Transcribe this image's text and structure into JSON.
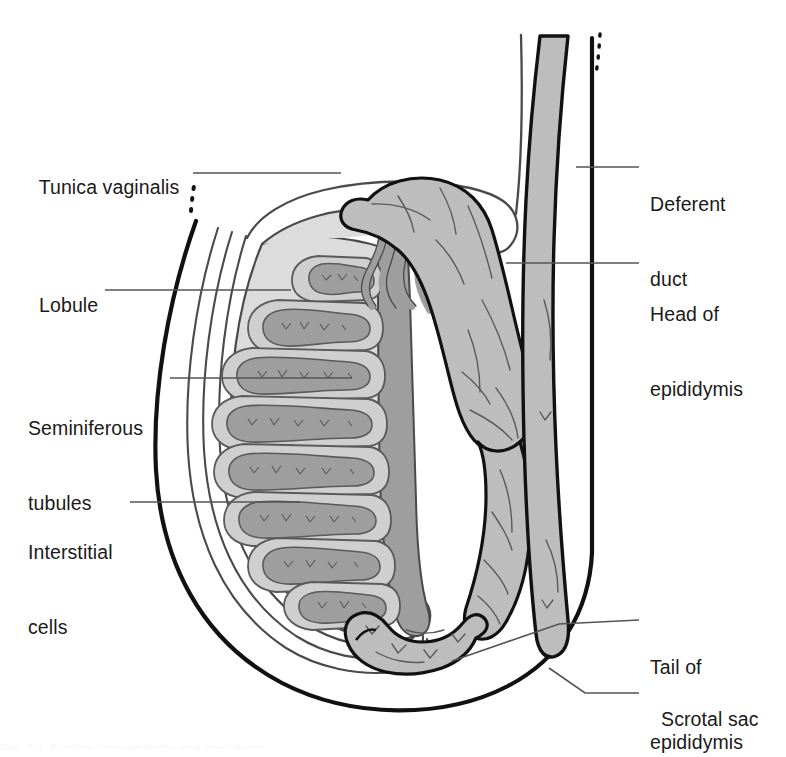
{
  "figure": {
    "background_color": "#ffffff",
    "outline_color": "#111111",
    "leader_line_color": "#555555",
    "colors": {
      "scrotal_sac_line": "#111111",
      "tunica_line": "#4a4a4a",
      "testis_parenchyma_fill": "#dcdcdc",
      "lobule_fill": "#cfcfcf",
      "seminiferous_tubule_fill": "#9e9e9e",
      "seminiferous_tubule_line": "#5a5a5a",
      "rete_testis_fill": "#9e9e9e",
      "epididymis_fill": "#bdbdbd",
      "deferent_duct_fill": "#bdbdbd",
      "label_text": "#1a1a1a"
    }
  },
  "labels": {
    "left": [
      {
        "id": "tunica-vaginalis",
        "lines": [
          "Tunica vaginalis"
        ],
        "x": 28,
        "y": 150
      },
      {
        "id": "lobule",
        "lines": [
          "Lobule"
        ],
        "x": 28,
        "y": 268
      },
      {
        "id": "seminiferous-tubules",
        "lines": [
          "Seminiferous",
          "tubules"
        ],
        "x": 28,
        "y": 366
      },
      {
        "id": "interstitial-cells",
        "lines": [
          "Interstitial",
          "cells"
        ],
        "x": 28,
        "y": 490
      }
    ],
    "right": [
      {
        "id": "deferent-duct",
        "lines": [
          "Deferent",
          "duct"
        ],
        "x": 650,
        "y": 142
      },
      {
        "id": "head-of-epididymis",
        "lines": [
          "Head of",
          "epididymis"
        ],
        "x": 650,
        "y": 252
      },
      {
        "id": "tail-of-epididymis",
        "lines": [
          "Tail of",
          "epididymis"
        ],
        "x": 650,
        "y": 605
      },
      {
        "id": "scrotal-sac",
        "lines": [
          "Scrotal sac"
        ],
        "x": 650,
        "y": 682
      }
    ]
  },
  "leaders": {
    "tunica_vaginalis": "M 193 173 L 341 173",
    "lobule": "M 105 290 L 291 290",
    "seminiferous": "M 170 378 L 352 378",
    "interstitial": "M 130 502 L 300 502",
    "deferent_duct": "M 639 167 L 576 167",
    "head_epididymis": "M 639 263 L 506 263",
    "tail_epididymis": "M 639 620 L 559 624 L 452 661",
    "scrotal_sac": "M 639 693 L 585 693 L 549 668"
  },
  "caption": {
    "partial_text": "Fig. 2.3  Section through testis and epididymis"
  }
}
